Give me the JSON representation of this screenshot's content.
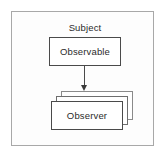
{
  "diagram": {
    "type": "uml-observer-pattern",
    "frame": {
      "border_color": "#a8a8a8",
      "background": "#fdfdfd"
    },
    "subject": {
      "label": "Subject"
    },
    "observable": {
      "label": "Observable",
      "border_color": "#4a4a4a",
      "background": "#ffffff"
    },
    "connector": {
      "style": "solid-line-with-filled-arrowhead",
      "direction": "down",
      "color": "#4a4a4a"
    },
    "observer": {
      "label": "Observer",
      "stack_count": 3,
      "border_color": "#4a4a4a",
      "background": "#ffffff"
    }
  }
}
